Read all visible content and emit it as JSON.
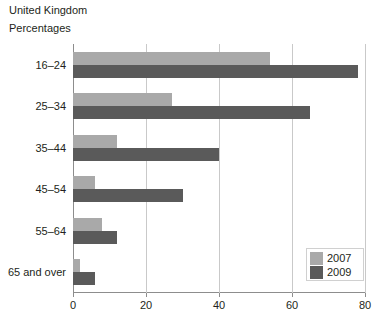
{
  "header": {
    "country": "United Kingdom",
    "units": "Percentages"
  },
  "legend": {
    "entries": [
      {
        "label": "2007",
        "color": "#a9a9a9"
      },
      {
        "label": "2009",
        "color": "#5a5a5a"
      }
    ]
  },
  "axis": {
    "x_ticks": [
      "0",
      "20",
      "40",
      "60",
      "80"
    ],
    "y_categories": [
      "16–24",
      "25–34",
      "35–44",
      "45–54",
      "55–64",
      "65 and over"
    ]
  },
  "chart_data": {
    "type": "bar",
    "orientation": "horizontal",
    "title": "United Kingdom",
    "subtitle": "Percentages",
    "xlabel": "",
    "ylabel": "",
    "xlim": [
      0,
      80
    ],
    "xticks": [
      0,
      20,
      40,
      60,
      80
    ],
    "grid": true,
    "legend_position": "bottom-right",
    "categories": [
      "16–24",
      "25–34",
      "35–44",
      "45–54",
      "55–64",
      "65 and over"
    ],
    "series": [
      {
        "name": "2007",
        "color": "#a9a9a9",
        "values": [
          54,
          27,
          12,
          6,
          8,
          2
        ]
      },
      {
        "name": "2009",
        "color": "#5a5a5a",
        "values": [
          78,
          65,
          40,
          30,
          12,
          6
        ]
      }
    ]
  }
}
